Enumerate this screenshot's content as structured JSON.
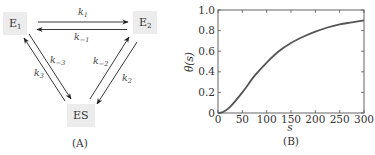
{
  "panel_a": {
    "label": "(A)",
    "nodes": [
      {
        "id": "E1",
        "text": "E",
        "sub": "1"
      },
      {
        "id": "E2",
        "text": "E",
        "sub": "2"
      },
      {
        "id": "ES",
        "text": "ES",
        "sub": ""
      }
    ],
    "rates": {
      "k1": {
        "base": "k",
        "sub": "1"
      },
      "km1": {
        "base": "k",
        "sub": "−1"
      },
      "k2": {
        "base": "k",
        "sub": "2"
      },
      "km2": {
        "base": "k",
        "sub": "−2"
      },
      "k3": {
        "base": "k",
        "sub": "3"
      },
      "km3": {
        "base": "k",
        "sub": "−3"
      }
    }
  },
  "panel_b": {
    "label": "(B)"
  },
  "chart_data": {
    "type": "line",
    "title": "",
    "xlabel": "s",
    "ylabel": "θ(s)",
    "xlim": [
      0,
      300
    ],
    "ylim": [
      0,
      1.0
    ],
    "xticks": [
      "0",
      "50",
      "100",
      "150",
      "200",
      "250",
      "300"
    ],
    "yticks": [
      "0",
      "0.2",
      "0.4",
      "0.6",
      "0.8",
      "1.0"
    ],
    "grid": false,
    "legend": "none",
    "series": [
      {
        "name": "θ(s)",
        "color": "#555555",
        "x": [
          0,
          10,
          25,
          50,
          75,
          100,
          125,
          150,
          175,
          200,
          225,
          250,
          275,
          300
        ],
        "y": [
          0,
          0.01,
          0.06,
          0.2,
          0.36,
          0.49,
          0.6,
          0.68,
          0.74,
          0.79,
          0.83,
          0.86,
          0.88,
          0.9
        ]
      }
    ]
  }
}
